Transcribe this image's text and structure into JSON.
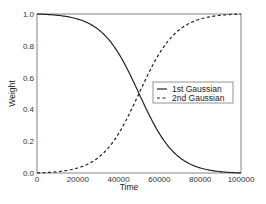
{
  "chart_data": {
    "type": "line",
    "title": "",
    "xlabel": "Time",
    "ylabel": "Weight",
    "xlim": [
      0,
      100000
    ],
    "ylim": [
      0.0,
      1.0
    ],
    "xticks": [
      "0",
      "20000",
      "40000",
      "60000",
      "80000",
      "100000"
    ],
    "yticks": [
      "0.0",
      "0.2",
      "0.4",
      "0.6",
      "0.8",
      "1.0"
    ],
    "grid": false,
    "legend_position": "center-right",
    "x": [
      0,
      10000,
      20000,
      30000,
      40000,
      50000,
      60000,
      70000,
      80000,
      90000,
      100000
    ],
    "series": [
      {
        "name": "1st Gaussian",
        "style": "solid",
        "values": [
          1.0,
          0.99,
          0.96,
          0.89,
          0.74,
          0.5,
          0.26,
          0.11,
          0.04,
          0.01,
          0.0
        ]
      },
      {
        "name": "2nd Gaussian",
        "style": "dashed",
        "values": [
          0.0,
          0.01,
          0.04,
          0.11,
          0.26,
          0.5,
          0.74,
          0.89,
          0.96,
          0.99,
          1.0
        ]
      }
    ]
  },
  "legend": {
    "items": [
      "1st Gaussian",
      "2nd Gaussian"
    ]
  },
  "axes": {
    "xlabel": "Time",
    "ylabel": "Weight"
  }
}
